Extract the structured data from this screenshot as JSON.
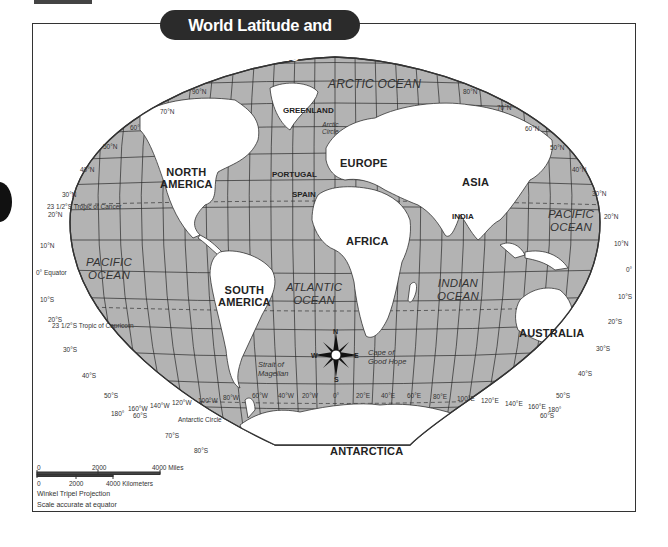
{
  "title": "World Latitude and Longitude",
  "projection_note": "Winkel Tripel Projection",
  "scale_note": "Scale accurate at equator",
  "scale_bar": {
    "miles": {
      "ticks": [
        "0",
        "2000",
        "4000 Miles"
      ]
    },
    "kilometers": {
      "ticks": [
        "0",
        "2000",
        "4000 Kilometers"
      ]
    }
  },
  "continents": {
    "north_america": "NORTH\nAMERICA",
    "south_america": "SOUTH\nAMERICA",
    "europe": "EUROPE",
    "asia": "ASIA",
    "africa": "AFRICA",
    "australia": "AUSTRALIA",
    "antarctica": "ANTARCTICA"
  },
  "countries": {
    "greenland": "GREENLAND",
    "portugal": "PORTUGAL",
    "spain": "SPAIN",
    "india": "INDIA"
  },
  "oceans": {
    "arctic": "ARCTIC OCEAN",
    "pacific_west": "PACIFIC\nOCEAN",
    "pacific_east": "PACIFIC\nOCEAN",
    "atlantic": "ATLANTIC\nOCEAN",
    "indian": "INDIAN\nOCEAN"
  },
  "features": {
    "arctic_circle": "Arctic\nCircle",
    "antarctic_circle": "Antarctic Circle",
    "tropic_cancer": "23 1/2°S  Tropic of Cancer",
    "tropic_capricorn": "23 1/2°S  Tropic of Capricorn",
    "equator": "0° Equator",
    "strait_magellan": "Strait of\nMagellan",
    "cape_good_hope": "Cape of\nGood Hope"
  },
  "compass": {
    "n": "N",
    "s": "S",
    "e": "E",
    "w": "W"
  },
  "latitude_labels_left": [
    "90°N",
    "70°N",
    "60°",
    "50°N",
    "40°N",
    "30°N",
    "20°N",
    "10°N",
    "0°",
    "10°S",
    "20°S",
    "30°S",
    "40°S",
    "50°S",
    "60°S",
    "70°S",
    "80°S"
  ],
  "latitude_labels_right": [
    "80°N",
    "70°N",
    "60°N",
    "50°N",
    "40°N",
    "30°N",
    "20°N",
    "10°N",
    "0°",
    "10°S",
    "20°S",
    "30°S",
    "40°S",
    "50°S",
    "60°S"
  ],
  "longitude_labels": [
    "180°",
    "160°W",
    "140°W",
    "120°W",
    "100°W",
    "80°W",
    "60°W",
    "40°W",
    "20°W",
    "0°",
    "20°E",
    "40°E",
    "60°E",
    "80°E",
    "100°E",
    "120°E",
    "140°E",
    "160°E",
    "180°"
  ],
  "colors": {
    "ocean": "#b3b3b3",
    "land": "#ffffff",
    "grid": "#2a2a2a",
    "title_bg": "#2b2b2b"
  }
}
